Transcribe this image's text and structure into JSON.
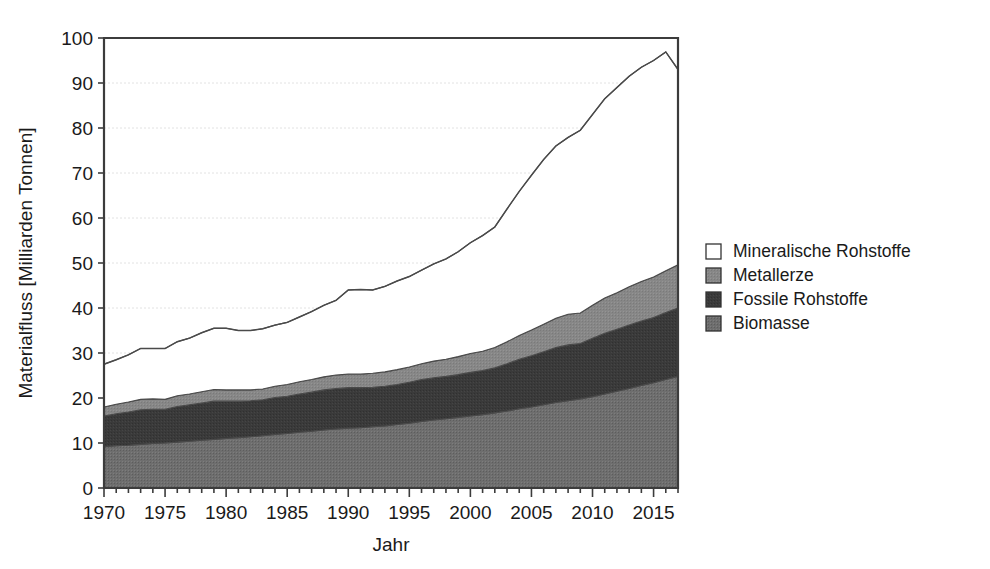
{
  "chart_data": {
    "type": "area",
    "stacked": true,
    "title": "",
    "subtitle": "",
    "xlabel": "Jahr",
    "ylabel": "Materialfluss  [Milliarden Tonnen]",
    "xlim": [
      1970,
      2017
    ],
    "ylim": [
      0,
      100
    ],
    "ytick_labels": [
      "0",
      "10",
      "20",
      "30",
      "40",
      "50",
      "60",
      "70",
      "80",
      "90",
      "100"
    ],
    "yticks": [
      0,
      10,
      20,
      30,
      40,
      50,
      60,
      70,
      80,
      90,
      100
    ],
    "xtick_labels": [
      "1970",
      "1975",
      "1980",
      "1985",
      "1990",
      "1995",
      "2000",
      "2005",
      "2010",
      "2015"
    ],
    "xticks": [
      1970,
      1975,
      1980,
      1985,
      1990,
      1995,
      2000,
      2005,
      2010,
      2015
    ],
    "xminor_step": 1,
    "grid": "horizontal-dotted",
    "legend_position": "right",
    "x": [
      1970,
      1971,
      1972,
      1973,
      1974,
      1975,
      1976,
      1977,
      1978,
      1979,
      1980,
      1981,
      1982,
      1983,
      1984,
      1985,
      1986,
      1987,
      1988,
      1989,
      1990,
      1991,
      1992,
      1993,
      1994,
      1995,
      1996,
      1997,
      1998,
      1999,
      2000,
      2001,
      2002,
      2003,
      2004,
      2005,
      2006,
      2007,
      2008,
      2009,
      2010,
      2011,
      2012,
      2013,
      2014,
      2015,
      2016,
      2017
    ],
    "series": [
      {
        "name": "Biomasse",
        "color": "#6e6e6e",
        "values": [
          9.2,
          9.4,
          9.5,
          9.7,
          9.9,
          10.0,
          10.2,
          10.4,
          10.6,
          10.8,
          11.0,
          11.2,
          11.4,
          11.6,
          11.9,
          12.1,
          12.4,
          12.6,
          12.9,
          13.1,
          13.3,
          13.4,
          13.6,
          13.8,
          14.1,
          14.4,
          14.8,
          15.1,
          15.4,
          15.7,
          16.0,
          16.3,
          16.7,
          17.1,
          17.6,
          18.0,
          18.5,
          19.0,
          19.4,
          19.8,
          20.3,
          20.9,
          21.5,
          22.1,
          22.8,
          23.4,
          24.1,
          24.8
        ]
      },
      {
        "name": "Fossile Rohstoffe",
        "color": "#3a3a3a",
        "values": [
          6.8,
          7.1,
          7.4,
          7.7,
          7.6,
          7.5,
          7.9,
          8.1,
          8.3,
          8.5,
          8.3,
          8.1,
          8.0,
          8.0,
          8.2,
          8.3,
          8.5,
          8.7,
          8.9,
          9.0,
          9.0,
          8.9,
          8.8,
          8.8,
          8.9,
          9.1,
          9.3,
          9.4,
          9.4,
          9.5,
          9.7,
          9.8,
          10.0,
          10.5,
          11.0,
          11.4,
          11.8,
          12.2,
          12.4,
          12.3,
          13.0,
          13.5,
          13.8,
          14.1,
          14.3,
          14.5,
          14.9,
          15.2
        ]
      },
      {
        "name": "Metallerze",
        "color": "#878787",
        "values": [
          2.0,
          2.1,
          2.2,
          2.3,
          2.3,
          2.2,
          2.4,
          2.4,
          2.5,
          2.6,
          2.5,
          2.5,
          2.4,
          2.4,
          2.5,
          2.6,
          2.7,
          2.8,
          2.9,
          3.0,
          3.0,
          3.0,
          3.1,
          3.2,
          3.3,
          3.4,
          3.5,
          3.7,
          3.8,
          4.0,
          4.2,
          4.3,
          4.5,
          4.9,
          5.3,
          5.7,
          6.1,
          6.5,
          6.8,
          6.8,
          7.3,
          7.8,
          8.1,
          8.5,
          8.8,
          9.0,
          9.3,
          9.6
        ]
      },
      {
        "name": "Mineralische Rohstoffe",
        "color": "#ffffff",
        "values": [
          9.5,
          9.9,
          10.5,
          11.3,
          11.2,
          11.3,
          12.0,
          12.4,
          13.1,
          13.6,
          13.7,
          13.2,
          13.2,
          13.4,
          13.6,
          13.8,
          14.4,
          15.1,
          15.9,
          16.6,
          18.7,
          18.8,
          18.5,
          19.0,
          19.7,
          20.1,
          20.8,
          21.6,
          22.3,
          23.3,
          24.6,
          25.7,
          26.8,
          29.5,
          32.0,
          34.4,
          36.6,
          38.3,
          39.3,
          40.6,
          42.4,
          44.3,
          45.6,
          46.8,
          47.6,
          48.1,
          48.6,
          43.4
        ]
      }
    ],
    "totals": [
      27.5,
      28.5,
      29.6,
      31.0,
      31.0,
      31.0,
      32.5,
      33.3,
      34.5,
      35.5,
      35.5,
      35.0,
      35.0,
      35.4,
      36.2,
      36.8,
      38.0,
      39.2,
      40.6,
      41.7,
      44.0,
      44.1,
      44.0,
      44.8,
      46.0,
      47.0,
      48.4,
      49.8,
      50.9,
      52.5,
      54.5,
      56.1,
      58.0,
      62.0,
      65.9,
      69.5,
      73.0,
      76.0,
      77.9,
      79.5,
      83.0,
      86.5,
      89.0,
      91.5,
      93.5,
      95.0,
      96.9,
      93.0
    ]
  },
  "axes": {
    "ylabel": "Materialfluss  [Milliarden Tonnen]",
    "xlabel": "Jahr",
    "ytick_labels": [
      "100",
      "90",
      "80",
      "70",
      "60",
      "50",
      "40",
      "30",
      "20",
      "10",
      "0"
    ],
    "xtick_labels": [
      "1970",
      "1975",
      "1980",
      "1985",
      "1990",
      "1995",
      "2000",
      "2005",
      "2010",
      "2015"
    ]
  },
  "legend": {
    "items": [
      {
        "label": "Mineralische Rohstoffe",
        "color": "#ffffff"
      },
      {
        "label": "Metallerze",
        "color": "#878787"
      },
      {
        "label": "Fossile Rohstoffe",
        "color": "#3a3a3a"
      },
      {
        "label": "Biomasse",
        "color": "#6e6e6e"
      }
    ]
  }
}
